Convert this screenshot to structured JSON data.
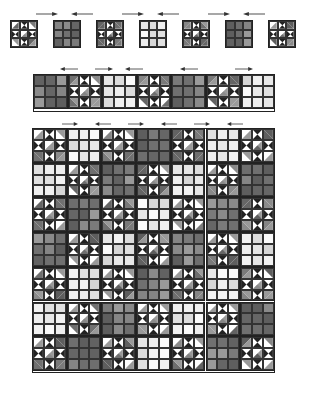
{
  "colors": {
    "dark_patches": [
      "#707070",
      "#858585",
      "#5e5e5e",
      "#7a7a7a",
      "#666666",
      "#8a8a8a",
      "#6e6e6e",
      "#9a9a9a",
      "#626262"
    ],
    "light_patches": [
      "#e6e6e6",
      "#f2f2f2",
      "#dcdcdc",
      "#eeeeee",
      "#fafafa",
      "#e0e0e0",
      "#d6d6d6",
      "#f0f0f0",
      "#e8e8e8"
    ],
    "star_point": "#222222",
    "star_light": "#ffffff",
    "star_mid": "#999999",
    "border": "#222222",
    "arrow": "#333333"
  },
  "legend": {
    "S": "Ohio star block",
    "D": "dark nine-patch block",
    "L": "light nine-patch block"
  },
  "block_row": {
    "label": "Block row (step 1)",
    "blocks": [
      "S",
      "D",
      "S",
      "L",
      "S",
      "D",
      "S"
    ],
    "arrows": [
      "right",
      "left",
      "right",
      "left",
      "right",
      "left"
    ]
  },
  "strip": {
    "label": "Sewn row strip (step 2)",
    "blocks": [
      "D",
      "S",
      "L",
      "S",
      "D",
      "S",
      "L"
    ],
    "arrows": [
      "left",
      "right",
      "left",
      "left",
      "right"
    ]
  },
  "quilt": {
    "label": "Quilt top assembly (step 3)",
    "rows": [
      [
        "S",
        "L",
        "S",
        "D",
        "S",
        "L",
        "S"
      ],
      [
        "L",
        "S",
        "D",
        "S",
        "L",
        "S",
        "D"
      ],
      [
        "S",
        "D",
        "S",
        "L",
        "S",
        "D",
        "S"
      ],
      [
        "D",
        "S",
        "L",
        "S",
        "D",
        "S",
        "L"
      ],
      [
        "S",
        "L",
        "S",
        "D",
        "S",
        "L",
        "S"
      ],
      [
        "L",
        "S",
        "D",
        "S",
        "L",
        "S",
        "D"
      ],
      [
        "S",
        "D",
        "S",
        "L",
        "S",
        "D",
        "S"
      ]
    ],
    "arrows": [
      "right",
      "left",
      "right",
      "left",
      "right",
      "left"
    ]
  }
}
